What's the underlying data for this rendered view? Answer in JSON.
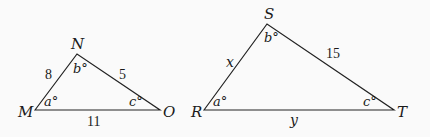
{
  "diagram": {
    "triangle_mno": {
      "vertices": {
        "M": "M",
        "N": "N",
        "O": "O"
      },
      "angles": {
        "M": "a°",
        "N": "b°",
        "O": "c°"
      },
      "sides": {
        "MN": "8",
        "NO": "5",
        "MO": "11"
      }
    },
    "triangle_rst": {
      "vertices": {
        "R": "R",
        "S": "S",
        "T": "T"
      },
      "angles": {
        "R": "a°",
        "S": "b°",
        "T": "c°"
      },
      "sides": {
        "RS": "x",
        "ST": "15",
        "RT": "y"
      }
    }
  }
}
